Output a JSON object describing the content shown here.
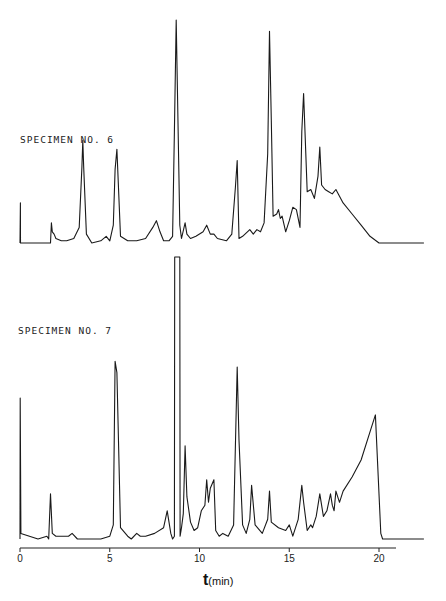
{
  "chart_data": [
    {
      "type": "line",
      "title": "SPECIMEN NO. 6",
      "xlabel": "t (min)",
      "ylabel": "",
      "xlim": [
        0,
        22.5
      ],
      "ylim": [
        0,
        100
      ],
      "grid": false,
      "baseline_px": 243,
      "scale_px": 2.23,
      "x": [
        0,
        0.02,
        0.03,
        1.0,
        1.7,
        1.75,
        1.8,
        1.9,
        2.0,
        2.3,
        2.6,
        3.0,
        3.3,
        3.45,
        3.5,
        3.55,
        3.7,
        4.0,
        4.5,
        4.8,
        5.0,
        5.2,
        5.3,
        5.4,
        5.6,
        6.0,
        6.5,
        7.0,
        7.4,
        7.6,
        7.8,
        8.0,
        8.3,
        8.5,
        8.6,
        8.7,
        8.9,
        9.0,
        9.2,
        9.3,
        9.5,
        9.8,
        10.2,
        10.4,
        10.6,
        10.8,
        11.0,
        11.5,
        11.8,
        12.0,
        12.1,
        12.2,
        12.4,
        12.8,
        13.0,
        13.2,
        13.4,
        13.6,
        13.8,
        13.9,
        14.0,
        14.1,
        14.3,
        14.4,
        14.5,
        14.6,
        14.8,
        15.0,
        15.2,
        15.4,
        15.6,
        15.7,
        15.8,
        16.0,
        16.2,
        16.4,
        16.6,
        16.7,
        16.8,
        17.0,
        17.2,
        17.4,
        17.6,
        17.8,
        18.0,
        18.5,
        19.0,
        19.5,
        20.0,
        20.5,
        22.5
      ],
      "values": [
        0,
        18,
        0,
        0,
        0,
        9,
        5,
        4,
        2,
        1,
        1,
        2,
        7,
        34,
        46,
        34,
        4,
        0,
        1,
        3,
        1,
        8,
        33,
        42,
        3,
        1,
        1,
        2,
        7,
        10,
        5,
        1,
        1,
        3,
        50,
        100,
        8,
        2,
        9,
        4,
        2,
        3,
        5,
        8,
        4,
        4,
        2,
        1,
        4,
        25,
        37,
        2,
        3,
        6,
        4,
        6,
        5,
        9,
        40,
        95,
        55,
        12,
        13,
        15,
        11,
        12,
        5,
        10,
        16,
        15,
        7,
        50,
        67,
        23,
        24,
        20,
        30,
        43,
        26,
        24,
        23,
        22,
        24,
        21,
        18,
        13,
        8,
        3,
        0,
        0,
        0
      ],
      "annotations": [
        "SPECIMEN NO. 6"
      ]
    },
    {
      "type": "line",
      "title": "SPECIMEN NO. 7",
      "xlabel": "t (min)",
      "ylabel": "",
      "xlim": [
        0,
        22.5
      ],
      "ylim": [
        0,
        100
      ],
      "grid": false,
      "baseline_px": 539,
      "scale_px": 2.82,
      "x": [
        0,
        0.01,
        0.05,
        1.0,
        1.5,
        1.6,
        1.7,
        1.8,
        2.0,
        2.7,
        2.9,
        3.2,
        4.5,
        5.0,
        5.2,
        5.3,
        5.4,
        5.6,
        6.0,
        6.2,
        6.5,
        6.7,
        7.0,
        7.5,
        8.0,
        8.2,
        8.4,
        8.5,
        8.6,
        8.62,
        8.9,
        8.92,
        9.0,
        9.1,
        9.2,
        9.3,
        9.5,
        9.7,
        9.9,
        10.1,
        10.3,
        10.4,
        10.5,
        10.6,
        10.8,
        10.9,
        11.1,
        11.3,
        11.6,
        11.9,
        12.1,
        12.2,
        12.4,
        12.6,
        12.8,
        12.9,
        13.1,
        13.5,
        13.8,
        13.9,
        14.0,
        14.4,
        14.8,
        15.0,
        15.2,
        15.5,
        15.7,
        15.8,
        16.0,
        16.2,
        16.3,
        16.5,
        16.7,
        16.8,
        16.9,
        17.1,
        17.3,
        17.4,
        17.5,
        17.6,
        17.8,
        18.0,
        18.5,
        19.0,
        19.5,
        19.8,
        20.1,
        20.2,
        21.0,
        22.5
      ],
      "values": [
        0,
        50,
        2,
        0,
        1,
        0,
        16,
        2,
        1,
        1,
        2,
        0,
        0,
        1,
        5,
        63,
        59,
        4,
        1,
        0,
        2,
        1,
        1,
        2,
        4,
        10,
        2,
        0,
        1,
        100,
        100,
        1,
        4,
        9,
        33,
        15,
        6,
        3,
        4,
        10,
        12,
        21,
        13,
        18,
        21,
        3,
        1,
        2,
        1,
        5,
        61,
        35,
        5,
        2,
        7,
        19,
        5,
        2,
        7,
        17,
        6,
        4,
        3,
        5,
        1,
        7,
        19,
        13,
        3,
        5,
        4,
        8,
        16,
        12,
        8,
        10,
        16,
        12,
        10,
        17,
        13,
        17,
        22,
        28,
        38,
        44,
        2,
        0,
        0,
        0
      ],
      "clipped_peak": {
        "x": 8.75,
        "note": "off-scale, flat top"
      },
      "annotations": [
        "SPECIMEN NO. 7"
      ]
    }
  ],
  "axis": {
    "ticks": [
      0,
      5,
      10,
      15,
      20
    ],
    "tick_labels": [
      "0",
      "5",
      "10",
      "15",
      "20"
    ],
    "x0_px": 20,
    "px_per_min": 17.95,
    "axis_y_px": 548,
    "axis_end_px": 396,
    "label_symbol": "t",
    "label_unit": "(min)"
  },
  "labels": {
    "specimen6": "SPECIMEN NO. 6",
    "specimen7": "SPECIMEN NO. 7"
  },
  "colors": {
    "trace": "#1a1a1a",
    "background": "#ffffff"
  }
}
